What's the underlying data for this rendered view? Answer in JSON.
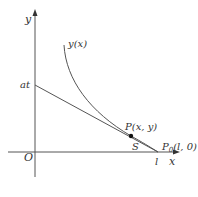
{
  "diagram": {
    "axes": {
      "x_label": "x",
      "y_label": "y",
      "origin_label": "O"
    },
    "curve_label": "y(x)",
    "y_intercept_label": "at",
    "point_P_label": "P(x, y)",
    "arc_length_label": "S",
    "point_P0_label": "P",
    "point_P0_subscript": "0",
    "point_P0_coords": "(l, 0)",
    "x_intercept_label": "l",
    "colors": {
      "stroke": "#555555",
      "text": "#333333",
      "point": "#111111"
    }
  }
}
